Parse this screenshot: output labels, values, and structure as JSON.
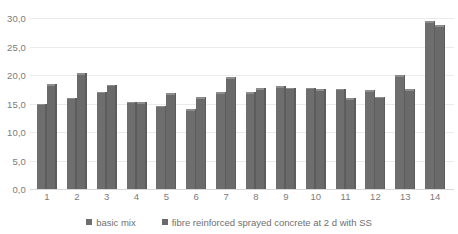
{
  "chart_data": {
    "type": "bar",
    "title": "",
    "subtitle": "",
    "xlabel": "",
    "ylabel": "",
    "categories": [
      "1",
      "2",
      "3",
      "4",
      "5",
      "6",
      "7",
      "8",
      "9",
      "10",
      "11",
      "12",
      "13",
      "14"
    ],
    "ylim": [
      0,
      30
    ],
    "ytick_values": [
      0,
      5,
      10,
      15,
      20,
      25,
      30
    ],
    "ytick_labels": [
      "0,0",
      "5,0",
      "10,0",
      "15,0",
      "20,0",
      "25,0",
      "30,0"
    ],
    "grid": true,
    "legend_position": "bottom",
    "series": [
      {
        "name": "basic mix",
        "color": "#6e6e6e",
        "values": [
          15.0,
          16.0,
          17.1,
          15.3,
          14.6,
          14.0,
          17.0,
          17.0,
          18.0,
          17.8,
          17.6,
          17.3,
          20.0,
          29.4
        ]
      },
      {
        "name": "fibre reinforced sprayed concrete at 2 d with SS",
        "color": "#6a6a6a",
        "values": [
          18.4,
          20.3,
          18.3,
          15.2,
          16.8,
          16.1,
          19.6,
          17.7,
          17.8,
          17.5,
          15.9,
          16.2,
          17.5,
          28.7
        ]
      }
    ]
  },
  "legend": {
    "items": [
      {
        "label": "basic mix"
      },
      {
        "label": "fibre reinforced sprayed concrete at 2 d with SS"
      }
    ]
  },
  "colors": {
    "bar_fill": "#6e6e6e",
    "bar_top": "#8d8d8d",
    "bar_edge": "#5d5d5d",
    "gridline": "#ebebeb",
    "axis_text": "#7b7b7b",
    "legend_text": "#6f6f6f",
    "background": "#ffffff"
  }
}
